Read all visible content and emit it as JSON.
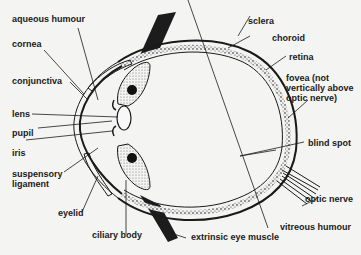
{
  "diagram": {
    "labels": {
      "aqueous_humour": "aqueous humour",
      "cornea": "cornea",
      "conjunctiva": "conjunctiva",
      "lens": "lens",
      "pupil": "pupil",
      "iris": "iris",
      "suspensory_ligament_1": "suspensory",
      "suspensory_ligament_2": "ligament",
      "eyelid": "eyelid",
      "ciliary_body": "ciliary body",
      "extrinsic_eye_muscle": "extrinsic eye muscle",
      "vitreous_humour": "vitreous humour",
      "optic_nerve": "optic nerve",
      "blind_spot": "blind spot",
      "fovea_1": "fovea (not",
      "fovea_2": "vertically above",
      "fovea_3": "optic nerve)",
      "retina": "retina",
      "choroid": "choroid",
      "sclera": "sclera"
    },
    "colors": {
      "background": "#f4f4f2",
      "ink": "#1a1a1a",
      "stipple": "#8a8a8a"
    }
  }
}
